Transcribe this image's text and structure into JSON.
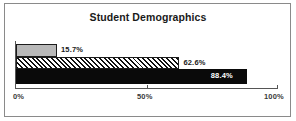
{
  "chart_data": {
    "type": "bar",
    "orientation": "horizontal",
    "title": "Student Demographics",
    "xlabel": "",
    "ylabel": "",
    "categories": [
      "series-1",
      "series-2",
      "series-3"
    ],
    "values": [
      15.7,
      62.6,
      88.4
    ],
    "data_labels": [
      "15.7%",
      "62.6%",
      "88.4%"
    ],
    "xlim": [
      0,
      100
    ],
    "x_ticks": [
      0,
      50,
      100
    ],
    "x_tick_labels": [
      "0%",
      "50%",
      "100%"
    ],
    "grid": false,
    "legend": false,
    "bar_styles": [
      "solid-gray",
      "diagonal-hatch",
      "solid-black"
    ],
    "colors": {
      "bar_1": "#b8b8b8",
      "bar_2": "#ffffff",
      "bar_3": "#0a0a0a",
      "outline": "#1c1c1c",
      "axis": "#555555",
      "text": "#1a1a1a",
      "border": "#8a8a8a",
      "background": "#ffffff"
    }
  }
}
